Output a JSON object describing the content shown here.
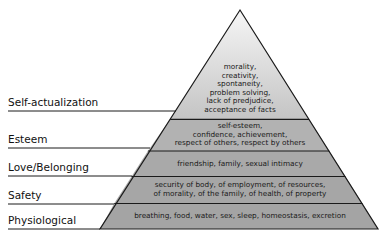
{
  "diagram": {
    "type": "pyramid",
    "colors": {
      "top_light": "#f4f4f4",
      "top_dark": "#c6c6c6",
      "band_fill": "#a9a9a9",
      "stroke": "#1a1a1a"
    },
    "levels": [
      {
        "label": "Self-actualization",
        "lines": [
          "morality,",
          "creativity,",
          "spontaneity,",
          "problem solving,",
          "lack of predjudice,",
          "acceptance of facts"
        ]
      },
      {
        "label": "Esteem",
        "lines": [
          "self-esteem,",
          "confidence, achievement,",
          "respect of others, respect by others"
        ]
      },
      {
        "label": "Love/Belonging",
        "lines": [
          "friendship, family, sexual intimacy"
        ]
      },
      {
        "label": "Safety",
        "lines": [
          "security of body, of employment, of resources,",
          "of morality, of the family, of health, of property"
        ]
      },
      {
        "label": "Physiological",
        "lines": [
          "breathing, food, water, sex, sleep, homeostasis, excretion"
        ]
      }
    ]
  }
}
